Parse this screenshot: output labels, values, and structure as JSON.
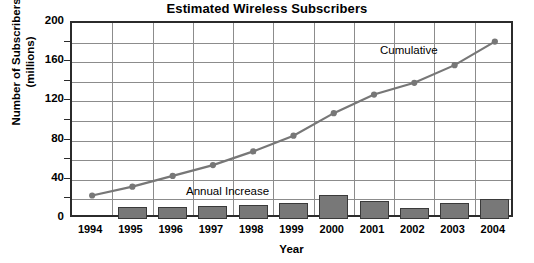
{
  "chart_data": {
    "type": "bar",
    "title": "Estimated Wireless Subscribers",
    "xlabel": "Year",
    "ylabel_line1": "Number of Subscribers",
    "ylabel_line2": "(millions)",
    "categories": [
      "1994",
      "1995",
      "1996",
      "1997",
      "1998",
      "1999",
      "2000",
      "2001",
      "2002",
      "2003",
      "2004"
    ],
    "ylim": [
      0,
      200
    ],
    "yticks": [
      0,
      40,
      80,
      120,
      160,
      200
    ],
    "ytick_labels": [
      "0",
      "40",
      "80",
      "120",
      "160",
      "200"
    ],
    "grid": true,
    "grid_minor_step": 20,
    "legend_position": "in-plot-annotations",
    "series": [
      {
        "name": "Annual Increase",
        "type": "bar",
        "color": "#787878",
        "values": [
          null,
          12,
          12,
          13,
          14,
          16,
          24,
          18,
          11,
          16,
          20
        ]
      },
      {
        "name": "Cumulative",
        "type": "line",
        "color": "#777777",
        "values": [
          24,
          33,
          44,
          55,
          69,
          85,
          108,
          127,
          139,
          157,
          181
        ]
      }
    ],
    "annotations": [
      {
        "name": "cumulative-label",
        "text": "Cumulative"
      },
      {
        "name": "annual-increase-label",
        "text": "Annual Increase"
      }
    ]
  },
  "colors": {
    "bar_fill": "#787878",
    "bar_stroke": "#3a3a3a",
    "line": "#777777",
    "grid": "#8c8c8c",
    "axis": "#2b2b2b",
    "text": "#000000",
    "background": "#ffffff"
  }
}
